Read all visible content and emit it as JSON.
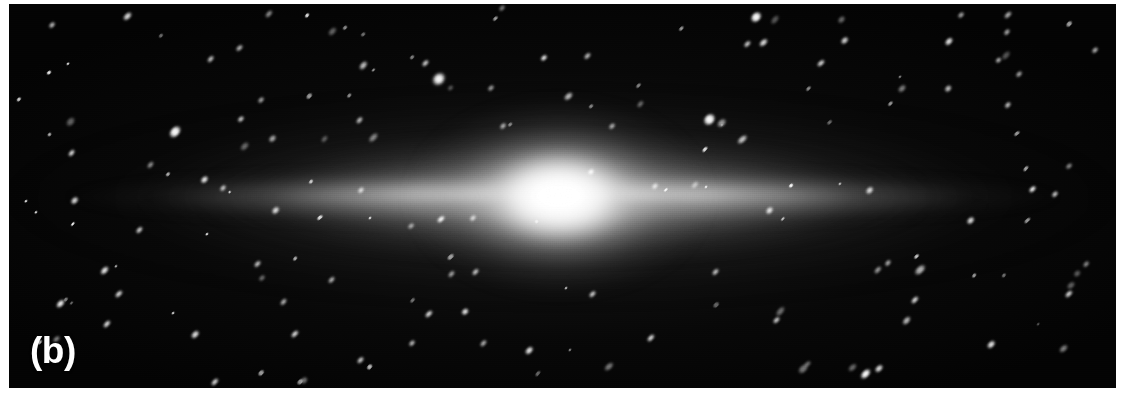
{
  "figure": {
    "panel_label": "(b)",
    "kind": "astronomical-image",
    "alt_description": "Grayscale astronomical image of an edge-on spiral galaxy with a bright central bulge, a thin horizontal disk, and a surrounding field of elongated point sources.",
    "canvas": {
      "width": 1128,
      "height": 403,
      "background_color": "#ffffff"
    },
    "plate": {
      "left": 9,
      "top": 4,
      "width": 1107,
      "height": 384,
      "background_color": "#050505",
      "sky_color": "#030303",
      "source_color": "#ffffff"
    },
    "galaxy": {
      "name_shown": "",
      "morphology": "edge-on disk galaxy",
      "disk_center_x_pct": 50.0,
      "disk_center_y_pct": 50.3,
      "disk_length_px": 1000,
      "disk_thickness_px": 66,
      "bulge_center_x_pct": 49.7,
      "bulge_center_y_pct": 50.3,
      "bulge_width_px": 300,
      "bulge_height_px": 190,
      "dust_lane_y_pct": 52.6
    },
    "point_sources": {
      "count": 172,
      "elongation_angle_deg": -45,
      "note": "point sources are trailed into diagonal ellipses oriented lower-left to upper-right"
    }
  },
  "chart_data": {
    "type": "heatmap",
    "title": "(b)",
    "xlabel": "",
    "ylabel": "",
    "colormap": "grayscale",
    "value_range": [
      0,
      255
    ],
    "profile_major_axis": {
      "x_px": [
        100,
        200,
        300,
        400,
        470,
        520,
        560,
        600,
        650,
        730,
        830,
        930,
        1030
      ],
      "brightness": [
        6,
        16,
        38,
        78,
        150,
        215,
        252,
        218,
        152,
        82,
        40,
        17,
        6
      ]
    },
    "profile_minor_axis": {
      "y_px": [
        110,
        140,
        165,
        182,
        197,
        212,
        230,
        255,
        290
      ],
      "brightness": [
        8,
        28,
        96,
        200,
        252,
        198,
        92,
        26,
        7
      ]
    },
    "stars": [
      {
        "x": 43,
        "y": 21,
        "r": 2.0,
        "a": -46,
        "e": 2.0,
        "i": 0.75
      },
      {
        "x": 118,
        "y": 12,
        "r": 2.4,
        "a": -44,
        "e": 2.2,
        "i": 0.85
      },
      {
        "x": 166,
        "y": 128,
        "r": 3.8,
        "a": -48,
        "e": 1.8,
        "i": 1.0
      },
      {
        "x": 230,
        "y": 44,
        "r": 2.1,
        "a": -42,
        "e": 2.1,
        "i": 0.7
      },
      {
        "x": 252,
        "y": 96,
        "r": 2.0,
        "a": -45,
        "e": 2.0,
        "i": 0.65
      },
      {
        "x": 300,
        "y": 92,
        "r": 1.8,
        "a": -47,
        "e": 2.3,
        "i": 0.6
      },
      {
        "x": 336,
        "y": 24,
        "r": 1.6,
        "a": -44,
        "e": 2.0,
        "i": 0.55
      },
      {
        "x": 417,
        "y": 59,
        "r": 2.2,
        "a": -45,
        "e": 2.1,
        "i": 0.8
      },
      {
        "x": 430,
        "y": 75,
        "r": 5.2,
        "a": -46,
        "e": 1.35,
        "i": 1.0
      },
      {
        "x": 486,
        "y": 15,
        "r": 1.7,
        "a": -43,
        "e": 2.0,
        "i": 0.6
      },
      {
        "x": 494,
        "y": 122,
        "r": 2.0,
        "a": -46,
        "e": 2.0,
        "i": 0.7
      },
      {
        "x": 578,
        "y": 52,
        "r": 2.1,
        "a": -45,
        "e": 2.1,
        "i": 0.72
      },
      {
        "x": 603,
        "y": 122,
        "r": 2.1,
        "a": -44,
        "e": 2.0,
        "i": 0.68
      },
      {
        "x": 630,
        "y": 82,
        "r": 1.6,
        "a": -46,
        "e": 2.2,
        "i": 0.5
      },
      {
        "x": 672,
        "y": 25,
        "r": 1.7,
        "a": -45,
        "e": 2.0,
        "i": 0.58
      },
      {
        "x": 700,
        "y": 116,
        "r": 4.6,
        "a": -47,
        "e": 1.4,
        "i": 1.0
      },
      {
        "x": 738,
        "y": 40,
        "r": 2.2,
        "a": -44,
        "e": 2.0,
        "i": 0.78
      },
      {
        "x": 747,
        "y": 13,
        "r": 3.9,
        "a": -45,
        "e": 1.6,
        "i": 1.0
      },
      {
        "x": 800,
        "y": 85,
        "r": 1.6,
        "a": -46,
        "e": 2.2,
        "i": 0.52
      },
      {
        "x": 836,
        "y": 36,
        "r": 2.3,
        "a": -43,
        "e": 2.0,
        "i": 0.82
      },
      {
        "x": 882,
        "y": 100,
        "r": 1.7,
        "a": -45,
        "e": 2.1,
        "i": 0.58
      },
      {
        "x": 940,
        "y": 38,
        "r": 2.6,
        "a": -46,
        "e": 1.9,
        "i": 0.9
      },
      {
        "x": 952,
        "y": 11,
        "r": 2.0,
        "a": -44,
        "e": 2.0,
        "i": 0.66
      },
      {
        "x": 1010,
        "y": 70,
        "r": 2.0,
        "a": -45,
        "e": 2.1,
        "i": 0.68
      },
      {
        "x": 1060,
        "y": 20,
        "r": 1.8,
        "a": -46,
        "e": 2.2,
        "i": 0.62
      },
      {
        "x": 1086,
        "y": 46,
        "r": 2.1,
        "a": -44,
        "e": 2.0,
        "i": 0.7
      },
      {
        "x": 66,
        "y": 196,
        "r": 2.4,
        "a": -45,
        "e": 1.9,
        "i": 0.85
      },
      {
        "x": 130,
        "y": 226,
        "r": 2.2,
        "a": -46,
        "e": 2.0,
        "i": 0.8
      },
      {
        "x": 196,
        "y": 176,
        "r": 2.6,
        "a": -44,
        "e": 1.8,
        "i": 0.92
      },
      {
        "x": 266,
        "y": 206,
        "r": 2.3,
        "a": -45,
        "e": 1.9,
        "i": 0.85
      },
      {
        "x": 352,
        "y": 186,
        "r": 2.2,
        "a": -46,
        "e": 1.9,
        "i": 0.8
      },
      {
        "x": 464,
        "y": 214,
        "r": 2.1,
        "a": -45,
        "e": 1.9,
        "i": 0.76
      },
      {
        "x": 646,
        "y": 182,
        "r": 2.2,
        "a": -44,
        "e": 1.9,
        "i": 0.8
      },
      {
        "x": 760,
        "y": 206,
        "r": 2.5,
        "a": -46,
        "e": 1.8,
        "i": 0.88
      },
      {
        "x": 860,
        "y": 186,
        "r": 2.3,
        "a": -45,
        "e": 1.9,
        "i": 0.84
      },
      {
        "x": 962,
        "y": 216,
        "r": 2.4,
        "a": -44,
        "e": 1.9,
        "i": 0.86
      },
      {
        "x": 1046,
        "y": 190,
        "r": 2.2,
        "a": -46,
        "e": 1.9,
        "i": 0.8
      },
      {
        "x": 52,
        "y": 300,
        "r": 2.6,
        "a": -45,
        "e": 2.2,
        "i": 0.95
      },
      {
        "x": 96,
        "y": 266,
        "r": 2.4,
        "a": -46,
        "e": 2.3,
        "i": 0.9
      },
      {
        "x": 110,
        "y": 290,
        "r": 2.2,
        "a": -44,
        "e": 2.2,
        "i": 0.85
      },
      {
        "x": 186,
        "y": 330,
        "r": 2.3,
        "a": -45,
        "e": 2.2,
        "i": 0.88
      },
      {
        "x": 206,
        "y": 378,
        "r": 2.2,
        "a": -46,
        "e": 2.2,
        "i": 0.84
      },
      {
        "x": 248,
        "y": 260,
        "r": 2.0,
        "a": -45,
        "e": 2.2,
        "i": 0.76
      },
      {
        "x": 286,
        "y": 330,
        "r": 2.2,
        "a": -44,
        "e": 2.2,
        "i": 0.86
      },
      {
        "x": 322,
        "y": 276,
        "r": 1.9,
        "a": -46,
        "e": 2.3,
        "i": 0.7
      },
      {
        "x": 352,
        "y": 356,
        "r": 2.1,
        "a": -45,
        "e": 2.2,
        "i": 0.8
      },
      {
        "x": 420,
        "y": 310,
        "r": 2.2,
        "a": -44,
        "e": 2.2,
        "i": 0.86
      },
      {
        "x": 466,
        "y": 268,
        "r": 2.0,
        "a": -46,
        "e": 2.2,
        "i": 0.76
      },
      {
        "x": 520,
        "y": 346,
        "r": 2.3,
        "a": -45,
        "e": 2.2,
        "i": 0.9
      },
      {
        "x": 584,
        "y": 290,
        "r": 2.1,
        "a": -44,
        "e": 2.2,
        "i": 0.8
      },
      {
        "x": 642,
        "y": 334,
        "r": 2.2,
        "a": -46,
        "e": 2.2,
        "i": 0.86
      },
      {
        "x": 706,
        "y": 268,
        "r": 2.0,
        "a": -45,
        "e": 2.2,
        "i": 0.76
      },
      {
        "x": 768,
        "y": 316,
        "r": 2.1,
        "a": -44,
        "e": 2.2,
        "i": 0.8
      },
      {
        "x": 856,
        "y": 370,
        "r": 2.8,
        "a": -45,
        "e": 2.3,
        "i": 1.0
      },
      {
        "x": 906,
        "y": 296,
        "r": 2.2,
        "a": -46,
        "e": 2.2,
        "i": 0.86
      },
      {
        "x": 982,
        "y": 340,
        "r": 2.3,
        "a": -45,
        "e": 2.2,
        "i": 0.9
      },
      {
        "x": 1060,
        "y": 290,
        "r": 2.2,
        "a": -44,
        "e": 2.2,
        "i": 0.84
      }
    ]
  }
}
